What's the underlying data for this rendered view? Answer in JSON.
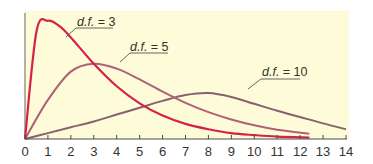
{
  "chart_data": {
    "type": "line",
    "title": "",
    "xlabel": "",
    "ylabel": "",
    "xlim": [
      0,
      14
    ],
    "ylim": [
      0,
      0.26
    ],
    "grid": false,
    "legend_position": "inline labels",
    "x_ticks": [
      "0",
      "1",
      "2",
      "3",
      "4",
      "5",
      "6",
      "7",
      "8",
      "9",
      "10",
      "11",
      "12",
      "13",
      "14"
    ],
    "background": "#fdfbd8",
    "series": [
      {
        "name": "d.f. = 3",
        "label_text": "d.f. = 3",
        "color": "#d6224a",
        "peak_x": 1,
        "x": [
          0,
          0.5,
          1,
          1.5,
          2,
          3,
          4,
          5,
          6,
          7,
          8,
          9,
          10,
          11,
          12.4
        ],
        "y": [
          0,
          0.22,
          0.242,
          0.231,
          0.208,
          0.154,
          0.108,
          0.073,
          0.048,
          0.031,
          0.02,
          0.012,
          0.008,
          0.005,
          0.003
        ]
      },
      {
        "name": "d.f. = 5",
        "label_text": "d.f. = 5",
        "color": "#b0607a",
        "peak_x": 3,
        "x": [
          0,
          1,
          2,
          3,
          4,
          5,
          6,
          7,
          8,
          9,
          10,
          11,
          12.4
        ],
        "y": [
          0,
          0.08,
          0.138,
          0.154,
          0.144,
          0.122,
          0.097,
          0.074,
          0.055,
          0.04,
          0.028,
          0.019,
          0.011
        ]
      },
      {
        "name": "d.f. = 10",
        "label_text": "d.f. = 10",
        "color": "#8a6070",
        "peak_x": 8,
        "x": [
          0,
          1,
          2,
          3,
          4,
          5,
          6,
          7,
          8,
          9,
          10,
          11,
          12,
          13,
          14
        ],
        "y": [
          0,
          0.012,
          0.024,
          0.036,
          0.05,
          0.064,
          0.078,
          0.09,
          0.094,
          0.086,
          0.072,
          0.058,
          0.045,
          0.032,
          0.02
        ]
      }
    ]
  }
}
